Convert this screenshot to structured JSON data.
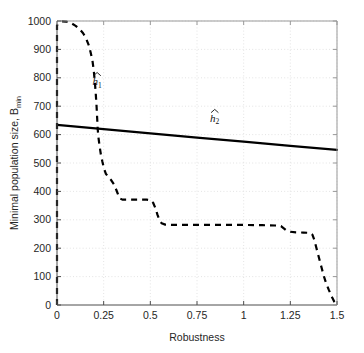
{
  "chart_data": {
    "type": "line",
    "title": "",
    "xlabel": "Robustness",
    "ylabel": "Minimal population size, B",
    "ylabel_sub": "min",
    "xlim": [
      0,
      1.5
    ],
    "ylim": [
      0,
      1000
    ],
    "xticks": [
      0,
      0.25,
      0.5,
      0.75,
      1,
      1.25,
      1.5
    ],
    "xticklabels": [
      "0",
      "0.25",
      "0.5",
      "0.75",
      "1",
      "1.25",
      "1.5"
    ],
    "yticks": [
      0,
      100,
      200,
      300,
      400,
      500,
      600,
      700,
      800,
      900,
      1000
    ],
    "yticklabels": [
      "0",
      "100",
      "200",
      "300",
      "400",
      "500",
      "600",
      "700",
      "800",
      "900",
      "1000"
    ],
    "grid": "dotted",
    "grid_color": "#d9d9d9",
    "axes_color": "#999999",
    "background": "#ffffff",
    "legend_position": "inline-annotations",
    "series": [
      {
        "name": "h1hat",
        "label": "h",
        "label_sub": "1",
        "style": "dashed",
        "color": "#000000",
        "linewidth": 2.2,
        "label_xy": [
          0.215,
          775
        ],
        "points": [
          [
            0.0,
            0
          ],
          [
            0.0,
            200
          ],
          [
            0.0,
            400
          ],
          [
            0.0,
            600
          ],
          [
            0.0,
            800
          ],
          [
            0.0,
            985
          ],
          [
            0.012,
            995
          ],
          [
            0.03,
            999
          ],
          [
            0.05,
            998
          ],
          [
            0.075,
            993
          ],
          [
            0.1,
            983
          ],
          [
            0.12,
            972
          ],
          [
            0.14,
            957
          ],
          [
            0.155,
            940
          ],
          [
            0.17,
            915
          ],
          [
            0.18,
            890
          ],
          [
            0.19,
            860
          ],
          [
            0.197,
            825
          ],
          [
            0.203,
            785
          ],
          [
            0.208,
            740
          ],
          [
            0.212,
            700
          ],
          [
            0.215,
            660
          ],
          [
            0.218,
            620
          ],
          [
            0.222,
            590
          ],
          [
            0.228,
            560
          ],
          [
            0.235,
            530
          ],
          [
            0.243,
            505
          ],
          [
            0.252,
            480
          ],
          [
            0.262,
            462
          ],
          [
            0.275,
            450
          ],
          [
            0.29,
            440
          ],
          [
            0.305,
            425
          ],
          [
            0.318,
            405
          ],
          [
            0.328,
            388
          ],
          [
            0.338,
            375
          ],
          [
            0.35,
            371
          ],
          [
            0.4,
            371
          ],
          [
            0.45,
            371
          ],
          [
            0.48,
            371
          ],
          [
            0.5,
            369
          ],
          [
            0.515,
            360
          ],
          [
            0.528,
            340
          ],
          [
            0.538,
            318
          ],
          [
            0.548,
            300
          ],
          [
            0.56,
            288
          ],
          [
            0.58,
            283
          ],
          [
            0.62,
            282
          ],
          [
            0.7,
            282
          ],
          [
            0.8,
            282
          ],
          [
            0.9,
            282
          ],
          [
            1.0,
            282
          ],
          [
            1.1,
            281
          ],
          [
            1.17,
            280
          ],
          [
            1.2,
            278
          ],
          [
            1.215,
            270
          ],
          [
            1.23,
            262
          ],
          [
            1.25,
            258
          ],
          [
            1.28,
            256
          ],
          [
            1.32,
            255
          ],
          [
            1.355,
            254
          ],
          [
            1.368,
            248
          ],
          [
            1.378,
            230
          ],
          [
            1.388,
            205
          ],
          [
            1.398,
            180
          ],
          [
            1.408,
            155
          ],
          [
            1.418,
            130
          ],
          [
            1.428,
            105
          ],
          [
            1.44,
            80
          ],
          [
            1.455,
            55
          ],
          [
            1.47,
            32
          ],
          [
            1.485,
            12
          ],
          [
            1.495,
            3
          ],
          [
            1.5,
            0
          ]
        ]
      },
      {
        "name": "h2hat",
        "label": "h",
        "label_sub": "2",
        "style": "solid",
        "color": "#000000",
        "linewidth": 2.2,
        "label_xy": [
          0.845,
          645
        ],
        "points": [
          [
            0.0,
            634
          ],
          [
            0.25,
            619
          ],
          [
            0.5,
            604
          ],
          [
            0.75,
            589
          ],
          [
            1.0,
            575
          ],
          [
            1.25,
            560
          ],
          [
            1.5,
            546
          ]
        ]
      }
    ]
  },
  "figure": {
    "plot_left": 57,
    "plot_right": 337,
    "plot_top": 21,
    "plot_bottom": 305
  }
}
